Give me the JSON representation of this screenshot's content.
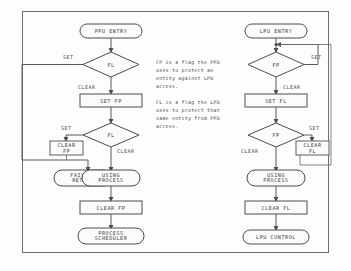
{
  "diagram": {
    "title_visible": false,
    "type": "flowchart",
    "border_color": "#6e6e6e",
    "line_color": "#5a5a5a",
    "text_color": "#3a3a3a",
    "notes": {
      "paragraph1": [
        "FP is a flag the PPU",
        "uses to protect an",
        "entity against LPU",
        "access."
      ],
      "paragraph2": [
        "FL is a flag the LPU",
        "uses to protect that",
        "same entity from PPU",
        "access."
      ]
    },
    "left_branch": {
      "name": "PPU flow",
      "entry": "PPU ENTRY",
      "decision1": "FL",
      "decision1_set": "SET",
      "decision1_clear": "CLEAR",
      "action1": "SET FP",
      "decision2": "FL",
      "decision2_set": "SET",
      "decision2_clear": "CLEAR",
      "action2_line1": "CLEAR",
      "action2_line2": "FP",
      "terminal_fail_line1": "FAILURE",
      "terminal_fail_line2": "RETURN",
      "terminal_ok_line1": "USING",
      "terminal_ok_line2": "PROCESS",
      "action3": "CLEAR FP",
      "exit_line1": "PROCESS",
      "exit_line2": "SCHEDULER"
    },
    "right_branch": {
      "name": "LPU flow",
      "entry": "LPU ENTRY",
      "decision1": "FP",
      "decision1_set": "SET",
      "decision1_clear": "CLEAR",
      "action1": "SET FL",
      "decision2": "FP",
      "decision2_set": "SET",
      "decision2_clear": "CLEAR",
      "action2_line1": "CLEAR",
      "action2_line2": "FL",
      "terminal_ok_line1": "USING",
      "terminal_ok_line2": "PROCESS",
      "action3": "CLEAR FL",
      "exit": "LPU CONTROL"
    }
  }
}
